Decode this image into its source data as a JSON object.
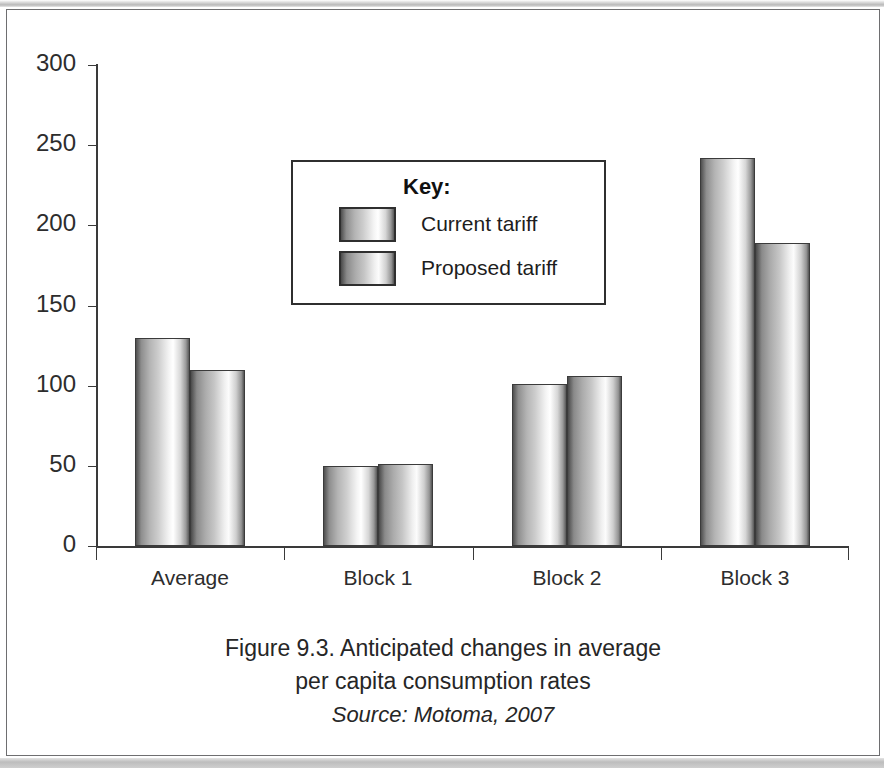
{
  "figure": {
    "caption_line1": "Figure 9.3. Anticipated changes in average",
    "caption_line2": "per capita consumption rates",
    "source": "Source: Motoma, 2007"
  },
  "legend": {
    "title": "Key:",
    "entries": [
      {
        "label": "Current tariff",
        "swatch": "current-tariff-swatch"
      },
      {
        "label": "Proposed tariff",
        "swatch": "proposed-tariff-swatch"
      }
    ]
  },
  "axis": {
    "y_ticks": [
      "0",
      "50",
      "100",
      "150",
      "200",
      "250",
      "300"
    ],
    "x_ticks": [
      "Average",
      "Block 1",
      "Block 2",
      "Block 3"
    ]
  },
  "chart_data": {
    "type": "bar",
    "title": "Figure 9.3. Anticipated changes in average per capita consumption rates",
    "subtitle": "Source: Motoma, 2007",
    "categories": [
      "Average",
      "Block 1",
      "Block 2",
      "Block 3"
    ],
    "series": [
      {
        "name": "Current tariff",
        "values": [
          130,
          50,
          101,
          242
        ]
      },
      {
        "name": "Proposed tariff",
        "values": [
          110,
          51,
          106,
          189
        ]
      }
    ],
    "xlabel": "",
    "ylabel": "",
    "ylim": [
      0,
      300
    ],
    "ytick_step": 50,
    "grid": false,
    "legend_position": "inside-upper-center",
    "legend_title": "Key:"
  }
}
